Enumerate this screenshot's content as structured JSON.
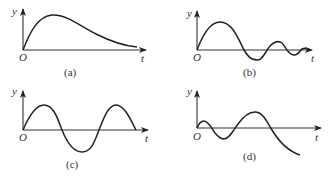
{
  "figure": {
    "panels": [
      {
        "id": "a",
        "caption": "(a)",
        "y_label": "y",
        "x_label": "t",
        "origin_label": "O",
        "description": "single hump rising from origin then decaying toward zero"
      },
      {
        "id": "b",
        "caption": "(b)",
        "y_label": "y",
        "x_label": "t",
        "origin_label": "O",
        "description": "damped oscillation decreasing in amplitude"
      },
      {
        "id": "c",
        "caption": "(c)",
        "y_label": "y",
        "x_label": "t",
        "origin_label": "O",
        "description": "sinusoid with constant amplitude, 1.5 periods"
      },
      {
        "id": "d",
        "caption": "(d)",
        "y_label": "y",
        "x_label": "t",
        "origin_label": "O",
        "description": "growing oscillation with increasing amplitude"
      }
    ]
  }
}
